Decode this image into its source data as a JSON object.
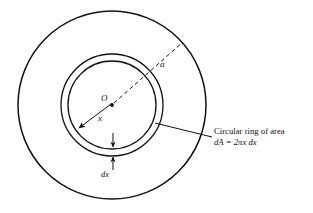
{
  "figure": {
    "type": "geometry-diagram",
    "labels": {
      "center_point": "O",
      "outer_radius": "a",
      "ring_radius": "x",
      "ring_thickness": "dx"
    },
    "callout": {
      "line1": "Circular ring of area",
      "line2_prefix": "dA",
      "line2_equals": "=",
      "line2_expr": "2πx dx",
      "line2_full": "dA = 2πx dx"
    },
    "geometry": {
      "center": {
        "x": 112,
        "y": 105
      },
      "outer_circle_radius": 94,
      "ring_inner_radius": 44,
      "ring_outer_radius": 51,
      "dashed_radius_endpoint": {
        "x": 183,
        "y": 42
      },
      "solid_radius_endpoint": {
        "x": 78,
        "y": 129
      },
      "leader_start": {
        "x": 155,
        "y": 124
      },
      "leader_end": {
        "x": 212,
        "y": 137
      }
    },
    "colors": {
      "stroke": "#111111",
      "background": "#ffffff",
      "text": "#111111"
    }
  }
}
